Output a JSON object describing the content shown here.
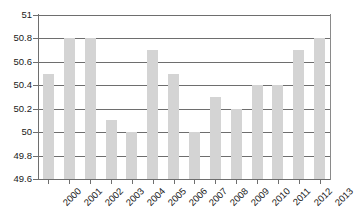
{
  "chart_data": {
    "type": "bar",
    "title": "",
    "subtitle": "",
    "xlabel": "",
    "ylabel": "",
    "categories": [
      "2000",
      "2001",
      "2002",
      "2003",
      "2004",
      "2005",
      "2006",
      "2007",
      "2008",
      "2009",
      "2010",
      "2011",
      "2012",
      "2013"
    ],
    "values": [
      50.5,
      50.8,
      50.8,
      50.1,
      50.0,
      50.7,
      50.5,
      50.0,
      50.3,
      50.2,
      50.4,
      50.4,
      50.7,
      50.8
    ],
    "ylim": [
      49.6,
      51
    ],
    "yticks": [
      51,
      50.8,
      50.6,
      50.4,
      50.2,
      50,
      49.8,
      49.6
    ],
    "ytick_labels": [
      "51",
      "50.8",
      "50.6",
      "50.4",
      "50.2",
      "50",
      "49.8",
      "49.6"
    ],
    "grid": true,
    "legend": false,
    "legend_position": "none",
    "series": [
      {
        "name": "",
        "values": [
          50.5,
          50.8,
          50.8,
          50.1,
          50.0,
          50.7,
          50.5,
          50.0,
          50.3,
          50.2,
          50.4,
          50.4,
          50.7,
          50.8
        ]
      }
    ],
    "colors": {
      "bar_fill": "#d4d4d4",
      "gridline": "#6e6e6e",
      "axis": "#6e6e6e",
      "text": "#1a1a1a",
      "background": "#ffffff"
    },
    "xtick_label_rotation": -45
  }
}
